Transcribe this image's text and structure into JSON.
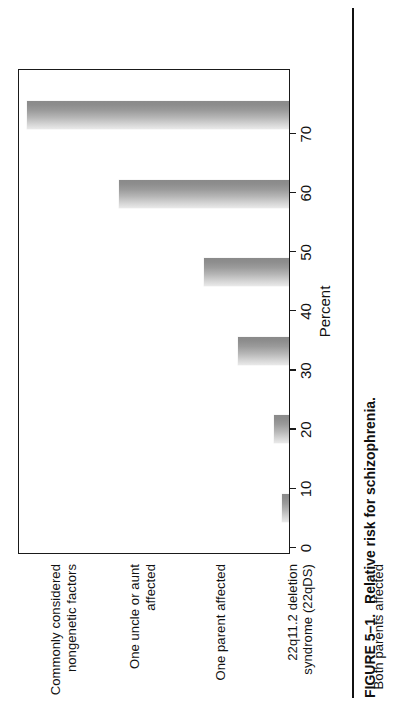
{
  "figure": {
    "number_label": "FIGURE 5–1.",
    "caption_text": "Relative risk for schizophrenia."
  },
  "chart_data": {
    "type": "bar",
    "title": "Relative risk for schizophrenia.",
    "xlabel": "",
    "ylabel": "Percent",
    "ylim": [
      0,
      80
    ],
    "grid": false,
    "legend": "none",
    "orientation": "vertical",
    "categories": [
      "Commonly considered\nnongenetic factors",
      "One uncle or aunt\naffected",
      "One parent affected",
      "22q11.2 deletion\nsyndrome (22qDS)",
      "Both parents affected",
      "Monozygotic twin\naffected"
    ],
    "values": [
      2,
      4.5,
      15,
      25,
      50,
      77
    ],
    "tick_labels": [
      "0",
      "10",
      "20",
      "30",
      "40",
      "50",
      "60",
      "70"
    ],
    "tick_values": [
      0,
      10,
      20,
      30,
      40,
      50,
      60,
      70
    ],
    "bar_fill": "#b0b0b0",
    "axis_color": "#1a1a1a"
  }
}
